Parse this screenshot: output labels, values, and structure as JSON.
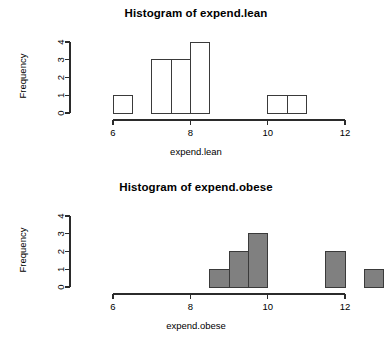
{
  "page": {
    "background": "#ffffff",
    "width": 392,
    "height": 348
  },
  "panels": [
    {
      "id": "lean",
      "title": "Histogram of expend.lean",
      "ylabel": "Frequency",
      "xlabel": "expend.lean"
    },
    {
      "id": "obese",
      "title": "Histogram of expend.obese",
      "ylabel": "Frequency",
      "xlabel": "expend.obese"
    }
  ],
  "chart_data": [
    {
      "type": "bar",
      "subtype": "histogram",
      "title": "Histogram of expend.lean",
      "xlabel": "expend.lean",
      "ylabel": "Frequency",
      "xlim": [
        6,
        12
      ],
      "ylim": [
        0,
        4
      ],
      "xticks": [
        6,
        8,
        10,
        12
      ],
      "yticks": [
        0,
        1,
        2,
        3,
        4
      ],
      "xtick_labels": [
        "6",
        "8",
        "10",
        "12"
      ],
      "ytick_labels": [
        "0",
        "1",
        "2",
        "3",
        "4"
      ],
      "grid": false,
      "legend": false,
      "bin_width": 0.5,
      "bar_fill": "#ffffff",
      "bar_stroke": "#3a3a3a",
      "bins": [
        {
          "start": 6.0,
          "end": 6.5,
          "count": 1
        },
        {
          "start": 6.5,
          "end": 7.0,
          "count": 0
        },
        {
          "start": 7.0,
          "end": 7.5,
          "count": 3
        },
        {
          "start": 7.5,
          "end": 8.0,
          "count": 3
        },
        {
          "start": 8.0,
          "end": 8.5,
          "count": 4
        },
        {
          "start": 8.5,
          "end": 9.0,
          "count": 0
        },
        {
          "start": 9.0,
          "end": 9.5,
          "count": 0
        },
        {
          "start": 9.5,
          "end": 10.0,
          "count": 0
        },
        {
          "start": 10.0,
          "end": 10.5,
          "count": 1
        },
        {
          "start": 10.5,
          "end": 11.0,
          "count": 1
        }
      ],
      "axis_x_start": 6.0,
      "axis_x_end": 12.0
    },
    {
      "type": "bar",
      "subtype": "histogram",
      "title": "Histogram of expend.obese",
      "xlabel": "expend.obese",
      "ylabel": "Frequency",
      "xlim": [
        6,
        13
      ],
      "ylim": [
        0,
        4
      ],
      "xticks": [
        6,
        8,
        10,
        12
      ],
      "yticks": [
        0,
        1,
        2,
        3,
        4
      ],
      "xtick_labels": [
        "6",
        "8",
        "10",
        "12"
      ],
      "ytick_labels": [
        "0",
        "1",
        "2",
        "3",
        "4"
      ],
      "grid": false,
      "legend": false,
      "bin_width": 0.5,
      "bar_fill": "#808080",
      "bar_stroke": "#3a3a3a",
      "bins": [
        {
          "start": 8.5,
          "end": 9.0,
          "count": 1
        },
        {
          "start": 9.0,
          "end": 9.5,
          "count": 2
        },
        {
          "start": 9.5,
          "end": 10.0,
          "count": 3
        },
        {
          "start": 11.5,
          "end": 12.0,
          "count": 2
        },
        {
          "start": 12.5,
          "end": 13.0,
          "count": 1
        }
      ],
      "axis_x_start": 6.0,
      "axis_x_end": 12.0
    }
  ]
}
